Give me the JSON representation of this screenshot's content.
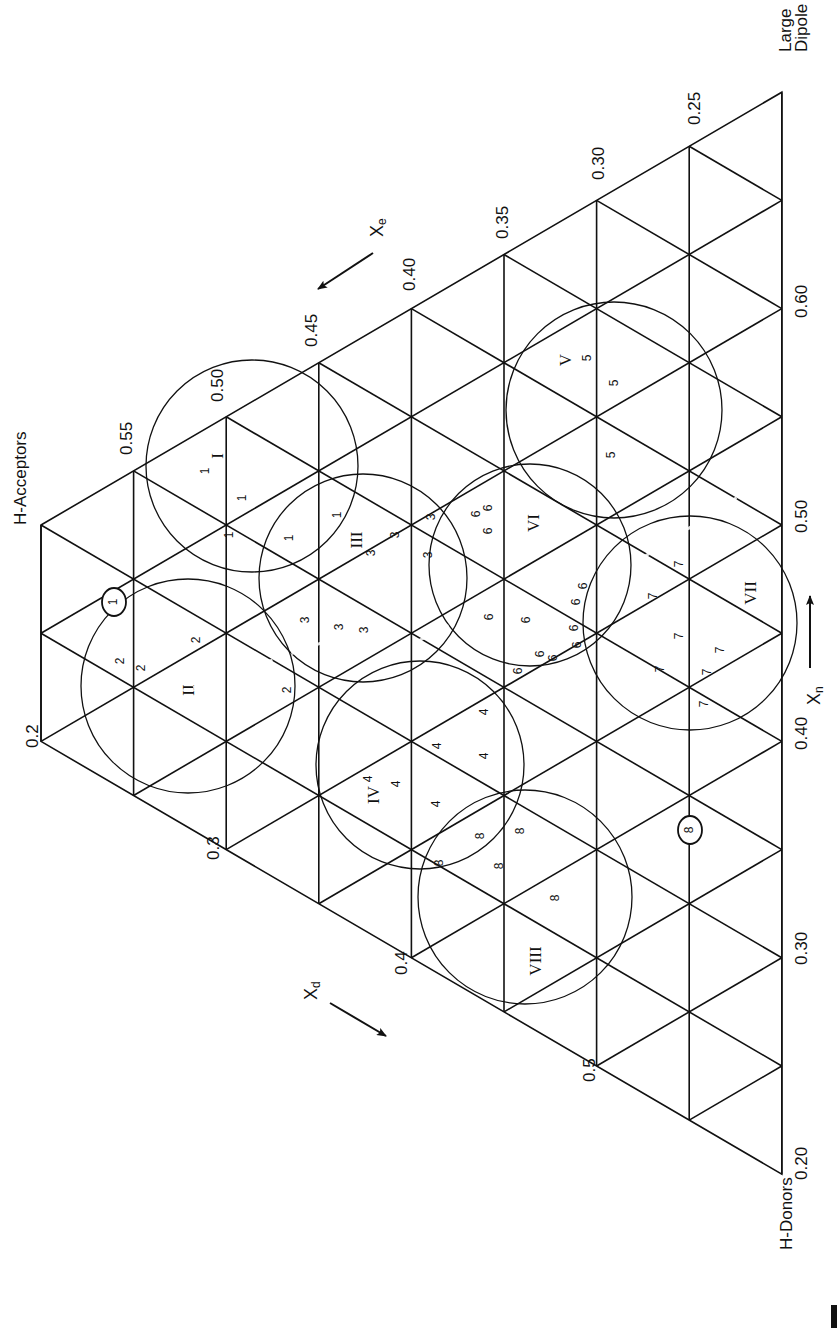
{
  "figure": {
    "type": "ternary-solvent-selectivity-triangle",
    "orientation": "rotated-90-ccw",
    "vertices": {
      "top_left": "H-Acceptors",
      "top_right": "Large Dipole",
      "bottom": "H-Donors"
    },
    "axes": {
      "xe": {
        "label": "X",
        "subscript": "e",
        "direction": "down-left along acceptor edge"
      },
      "xd": {
        "label": "X",
        "subscript": "d",
        "direction": "down-right along donor edge"
      },
      "xn": {
        "label": "X",
        "subscript": "n",
        "direction": "upward along dipole edge"
      }
    },
    "ticks": {
      "xe_edge": [
        "0.55",
        "0.50",
        "0.45",
        "0.40",
        "0.35",
        "0.30",
        "0.25"
      ],
      "xd_edge": [
        "0.2",
        "0.3",
        "0.4",
        "0.5"
      ],
      "xn_edge": [
        "0.60",
        "0.50",
        "0.40",
        "0.30",
        "0.20"
      ]
    },
    "groups": [
      {
        "id": "I",
        "member_label": "1",
        "member_count": 5
      },
      {
        "id": "II",
        "member_label": "2",
        "member_count": 5
      },
      {
        "id": "III",
        "member_label": "3",
        "member_count": 7
      },
      {
        "id": "IV",
        "member_label": "4",
        "member_count": 6
      },
      {
        "id": "V",
        "member_label": "5",
        "member_count": 4
      },
      {
        "id": "VI",
        "member_label": "6",
        "member_count": 12
      },
      {
        "id": "VII",
        "member_label": "7",
        "member_count": 7
      },
      {
        "id": "VIII",
        "member_label": "8",
        "member_count": 5
      }
    ],
    "circled_points": [
      "1",
      "8"
    ]
  },
  "grid": {
    "x0": 41,
    "dx": 92.6,
    "y_top0": 525,
    "node_step": 108.2,
    "columns": 8,
    "left_nodes": 2
  },
  "circles": [
    {
      "id": "I",
      "cx": 252,
      "cy": 466,
      "r": 106,
      "label": "I",
      "lx": 219,
      "ly": 456
    },
    {
      "id": "II",
      "cx": 188,
      "cy": 686,
      "r": 107,
      "label": "II",
      "lx": 190,
      "ly": 690
    },
    {
      "id": "III",
      "cx": 363,
      "cy": 578,
      "r": 104,
      "label": "III",
      "lx": 358,
      "ly": 540
    },
    {
      "id": "IV",
      "cx": 420,
      "cy": 765,
      "r": 104,
      "label": "IV",
      "lx": 375,
      "ly": 795
    },
    {
      "id": "V",
      "cx": 614,
      "cy": 410,
      "r": 108,
      "label": "V",
      "lx": 567,
      "ly": 360
    },
    {
      "id": "VI",
      "cx": 530,
      "cy": 565,
      "r": 101,
      "label": "VI",
      "lx": 535,
      "ly": 523
    },
    {
      "id": "VII",
      "cx": 690,
      "cy": 623,
      "r": 107,
      "label": "VII",
      "lx": 752,
      "ly": 593
    },
    {
      "id": "VIII",
      "cx": 525,
      "cy": 897,
      "r": 107,
      "label": "VIII",
      "lx": 537,
      "ly": 961
    }
  ],
  "members": [
    {
      "t": "1",
      "x": 206,
      "y": 471
    },
    {
      "t": "1",
      "x": 243,
      "y": 498
    },
    {
      "t": "1",
      "x": 338,
      "y": 515
    },
    {
      "t": "1",
      "x": 290,
      "y": 538
    },
    {
      "t": "1",
      "x": 230,
      "y": 535
    },
    {
      "t": "2",
      "x": 121,
      "y": 661
    },
    {
      "t": "2",
      "x": 142,
      "y": 668
    },
    {
      "t": "2",
      "x": 197,
      "y": 640
    },
    {
      "t": "2",
      "x": 288,
      "y": 690
    },
    {
      "t": "3",
      "x": 372,
      "y": 553
    },
    {
      "t": "3",
      "x": 396,
      "y": 535
    },
    {
      "t": "3",
      "x": 432,
      "y": 517
    },
    {
      "t": "3",
      "x": 306,
      "y": 620
    },
    {
      "t": "3",
      "x": 365,
      "y": 630
    },
    {
      "t": "3",
      "x": 429,
      "y": 555
    },
    {
      "t": "3",
      "x": 340,
      "y": 627
    },
    {
      "t": "4",
      "x": 369,
      "y": 779
    },
    {
      "t": "4",
      "x": 397,
      "y": 784
    },
    {
      "t": "4",
      "x": 438,
      "y": 746
    },
    {
      "t": "4",
      "x": 485,
      "y": 756
    },
    {
      "t": "4",
      "x": 437,
      "y": 804
    },
    {
      "t": "4",
      "x": 485,
      "y": 712
    },
    {
      "t": "5",
      "x": 588,
      "y": 358
    },
    {
      "t": "5",
      "x": 615,
      "y": 383
    },
    {
      "t": "5",
      "x": 612,
      "y": 455
    },
    {
      "t": "6",
      "x": 477,
      "y": 514
    },
    {
      "t": "6",
      "x": 489,
      "y": 508
    },
    {
      "t": "6",
      "x": 489,
      "y": 531
    },
    {
      "t": "6",
      "x": 490,
      "y": 617
    },
    {
      "t": "6",
      "x": 527,
      "y": 620
    },
    {
      "t": "6",
      "x": 541,
      "y": 654
    },
    {
      "t": "6",
      "x": 578,
      "y": 645
    },
    {
      "t": "6",
      "x": 575,
      "y": 628
    },
    {
      "t": "6",
      "x": 577,
      "y": 602
    },
    {
      "t": "6",
      "x": 584,
      "y": 586
    },
    {
      "t": "6",
      "x": 554,
      "y": 658
    },
    {
      "t": "6",
      "x": 519,
      "y": 671
    },
    {
      "t": "7",
      "x": 680,
      "y": 564
    },
    {
      "t": "7",
      "x": 654,
      "y": 596
    },
    {
      "t": "7",
      "x": 680,
      "y": 636
    },
    {
      "t": "7",
      "x": 721,
      "y": 650
    },
    {
      "t": "7",
      "x": 661,
      "y": 669
    },
    {
      "t": "7",
      "x": 708,
      "y": 672
    },
    {
      "t": "7",
      "x": 705,
      "y": 704
    },
    {
      "t": "8",
      "x": 440,
      "y": 863
    },
    {
      "t": "8",
      "x": 481,
      "y": 836
    },
    {
      "t": "8",
      "x": 521,
      "y": 831
    },
    {
      "t": "8",
      "x": 556,
      "y": 898
    },
    {
      "t": "8",
      "x": 500,
      "y": 866
    }
  ],
  "circled": [
    {
      "t": "1",
      "x": 114,
      "y": 602,
      "r": 14
    },
    {
      "t": "8",
      "x": 690,
      "y": 830,
      "r": 14
    }
  ],
  "ticks_pos": {
    "xe": [
      {
        "t": "0.55",
        "x": 128,
        "y": 455
      },
      {
        "t": "0.50",
        "x": 219,
        "y": 402
      },
      {
        "t": "0.45",
        "x": 313,
        "y": 347
      },
      {
        "t": "0.40",
        "x": 411,
        "y": 291
      },
      {
        "t": "0.35",
        "x": 504,
        "y": 239
      },
      {
        "t": "0.30",
        "x": 600,
        "y": 180
      },
      {
        "t": "0.25",
        "x": 696,
        "y": 125
      }
    ],
    "xd": [
      {
        "t": "0.2",
        "x": 34,
        "y": 748
      },
      {
        "t": "0.3",
        "x": 215,
        "y": 860
      },
      {
        "t": "0.4",
        "x": 403,
        "y": 975
      },
      {
        "t": "0.5",
        "x": 591,
        "y": 1082
      }
    ],
    "xn": [
      {
        "t": "0.60",
        "x": 803,
        "y": 318
      },
      {
        "t": "0.50",
        "x": 803,
        "y": 533
      },
      {
        "t": "0.40",
        "x": 803,
        "y": 750
      },
      {
        "t": "0.30",
        "x": 803,
        "y": 965
      },
      {
        "t": "0.20",
        "x": 803,
        "y": 1180
      }
    ]
  },
  "vertex_labels": [
    {
      "t": "H-Acceptors",
      "x": 22,
      "y": 525
    },
    {
      "t": "Large",
      "x": 787,
      "y": 52
    },
    {
      "t": "Dipole",
      "x": 803,
      "y": 52
    },
    {
      "t": "H-Donors",
      "x": 788,
      "y": 1250
    }
  ],
  "arrows": [
    {
      "name": "xe-arrow",
      "x1": 373,
      "y1": 253,
      "x2": 318,
      "y2": 289,
      "lx": 378,
      "ly": 237
    },
    {
      "name": "xd-arrow",
      "x1": 330,
      "y1": 1003,
      "x2": 386,
      "y2": 1036,
      "lx": 312,
      "ly": 1000
    },
    {
      "name": "xn-arrow",
      "x1": 810,
      "y1": 668,
      "x2": 810,
      "y2": 596,
      "lx": 815,
      "ly": 705
    }
  ]
}
